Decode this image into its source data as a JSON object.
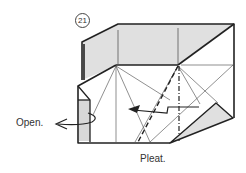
{
  "diagram": {
    "step_number": "21",
    "labels": {
      "open": "Open.",
      "pleat": "Pleat."
    },
    "colors": {
      "paper_shaded": "#e0e0e0",
      "paper_white": "#ffffff",
      "line": "#222222"
    },
    "instructions": [
      "Open.",
      "Pleat."
    ]
  }
}
